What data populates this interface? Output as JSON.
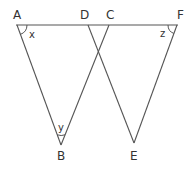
{
  "diagram": {
    "type": "geometry",
    "colors": {
      "line": "#555555",
      "text": "#333333",
      "background": "#ffffff"
    },
    "points": {
      "A": {
        "label": "A",
        "x": 17,
        "y": 25
      },
      "D": {
        "label": "D",
        "x": 88,
        "y": 25
      },
      "C": {
        "label": "C",
        "x": 109,
        "y": 25
      },
      "F": {
        "label": "F",
        "x": 177,
        "y": 25
      },
      "B": {
        "label": "B",
        "x": 61,
        "y": 145
      },
      "E": {
        "label": "E",
        "x": 134,
        "y": 143
      }
    },
    "segments": [
      [
        "A",
        "F"
      ],
      [
        "A",
        "B"
      ],
      [
        "B",
        "C"
      ],
      [
        "D",
        "E"
      ],
      [
        "E",
        "F"
      ]
    ],
    "angles": [
      {
        "vertex": "A",
        "label": "x"
      },
      {
        "vertex": "B",
        "label": "y"
      },
      {
        "vertex": "F",
        "label": "z"
      }
    ]
  }
}
